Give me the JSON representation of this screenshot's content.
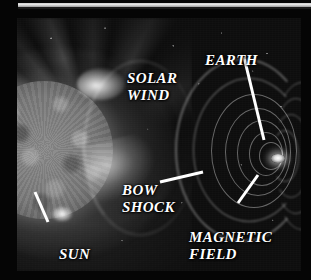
{
  "figure": {
    "kind": "scientific-illustration",
    "palette": {
      "background": "#000000",
      "plate_background": "#0d0d0d",
      "label_color": "#ffffff",
      "leader_line_color": "#ffffff",
      "top_strip": "#e6e6e6"
    }
  },
  "labels": [
    {
      "id": "solar-wind",
      "text": "SOLAR\nWIND",
      "lines": [
        "SOLAR",
        "WIND"
      ],
      "has_leader": false
    },
    {
      "id": "earth",
      "text": "EARTH",
      "lines": [
        "EARTH"
      ],
      "has_leader": true,
      "leader": {
        "x1": 227,
        "y1": 39,
        "x2": 247,
        "y2": 122
      }
    },
    {
      "id": "bow-shock",
      "text": "BOW\nSHOCK",
      "lines": [
        "BOW",
        "SHOCK"
      ],
      "has_leader": true,
      "leader": {
        "x1": 143,
        "y1": 164,
        "x2": 186,
        "y2": 154
      }
    },
    {
      "id": "magnetic-field",
      "text": "MAGNETIC\nFIELD",
      "lines": [
        "MAGNETIC",
        "FIELD"
      ],
      "has_leader": true,
      "leader": {
        "x1": 221,
        "y1": 185,
        "x2": 241,
        "y2": 157
      }
    },
    {
      "id": "sun",
      "text": "SUN",
      "lines": [
        "SUN"
      ],
      "has_leader": true,
      "leader": {
        "x1": 18,
        "y1": 174,
        "x2": 31,
        "y2": 204
      }
    }
  ],
  "objects": [
    {
      "id": "sun",
      "name": "Sun",
      "description": "mottled solar disk with corona, partially cropped at the left edge"
    },
    {
      "id": "solar-wind",
      "name": "Solar wind",
      "description": "bright plasma streamers flowing from the Sun toward the right"
    },
    {
      "id": "bow-shock",
      "name": "Bow shock",
      "description": "curved luminous shock front upstream of Earth"
    },
    {
      "id": "earth",
      "name": "Earth",
      "description": "small bright point at the center of the magnetosphere"
    },
    {
      "id": "magnetic-field",
      "name": "Magnetic field",
      "description": "nested arc-shaped magnetic field lines forming the magnetosphere and tail"
    }
  ]
}
